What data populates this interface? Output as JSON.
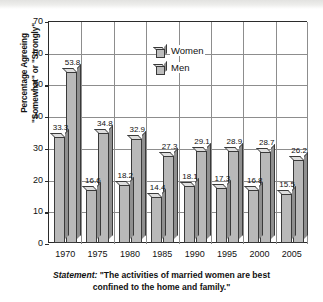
{
  "chart_data": {
    "type": "bar",
    "title": "",
    "subtitle": "",
    "xlabel": "",
    "ylabel": "Percentage Agreeing \"Somewhat\" or \"Strongly\"",
    "ylabel_lines": [
      "Percentage Agreeing",
      "\"Somewhat\" or \"Strongly\""
    ],
    "categories": [
      "1970",
      "1975",
      "1980",
      "1985",
      "1990",
      "1995",
      "2000",
      "2005"
    ],
    "series": [
      {
        "name": "Women",
        "values": [
          33.3,
          16.6,
          18.2,
          14.4,
          18.1,
          17.3,
          16.8,
          15.5
        ]
      },
      {
        "name": "Men",
        "values": [
          53.8,
          34.8,
          32.9,
          27.3,
          29.1,
          28.9,
          28.7,
          26.2
        ]
      }
    ],
    "ylim": [
      0,
      70
    ],
    "yticks": [
      0,
      10,
      20,
      30,
      40,
      50,
      60,
      70
    ],
    "ytick_labels": [
      "0",
      "10",
      "20",
      "30",
      "40",
      "50",
      "60",
      "70"
    ],
    "grid": true,
    "legend_position": "inside-top-center",
    "bar_style": "3d",
    "colors": {
      "bar_face": "#b9b9b9",
      "bar_side": "#8f8f8f",
      "bar_top": "#dedede",
      "outline": "#3a3a3a",
      "grid": "#8d8d8d",
      "axis": "#2b2b2b",
      "text": "#111111",
      "background": "#ffffff"
    }
  },
  "legend": {
    "items": [
      {
        "label": "Women",
        "icon": "cube-icon"
      },
      {
        "label": "Men",
        "icon": "cube-icon"
      }
    ]
  },
  "caption": {
    "prefix": "Statement:",
    "line1": "\"The activities of married women are best",
    "line2": "confined to the home and family.\""
  }
}
